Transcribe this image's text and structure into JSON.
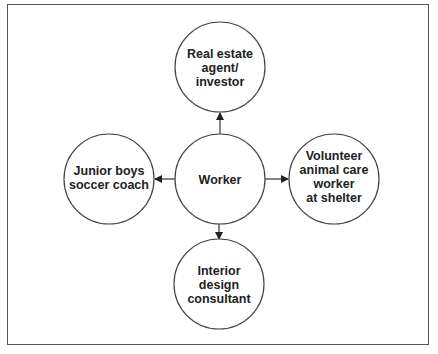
{
  "diagram": {
    "center": {
      "label_lines": [
        "Worker"
      ]
    },
    "nodes": [
      {
        "id": "top",
        "label_lines": [
          "Real estate",
          "agent/",
          "investor"
        ]
      },
      {
        "id": "left",
        "label_lines": [
          "Junior boys",
          "soccer coach"
        ]
      },
      {
        "id": "right",
        "label_lines": [
          "Volunteer",
          "animal care",
          "worker",
          "at shelter"
        ]
      },
      {
        "id": "bottom",
        "label_lines": [
          "Interior",
          "design",
          "consultant"
        ]
      }
    ],
    "edges": [
      {
        "from": "center",
        "to": "top"
      },
      {
        "from": "center",
        "to": "left"
      },
      {
        "from": "center",
        "to": "right"
      },
      {
        "from": "center",
        "to": "bottom"
      }
    ]
  }
}
